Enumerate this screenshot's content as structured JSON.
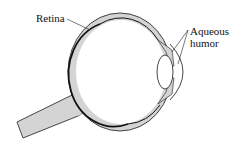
{
  "diagram": {
    "labels": {
      "retina": "Retina",
      "aqueous_line1": "Aqueous",
      "aqueous_line2": "humor"
    },
    "colors": {
      "tissue_fill": "#d4d4d4",
      "outline": "#1a1a1a",
      "background": "#ffffff"
    }
  }
}
